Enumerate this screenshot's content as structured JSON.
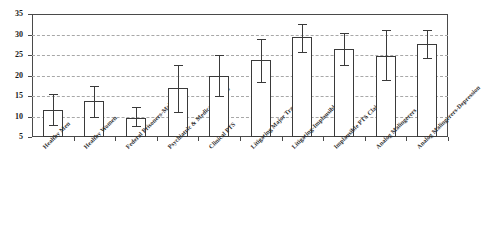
{
  "chart_data": {
    "type": "bar",
    "title": "",
    "xlabel": "",
    "ylabel": "",
    "ylim": [
      5,
      35
    ],
    "yticks": [
      5,
      10,
      15,
      20,
      25,
      30,
      35
    ],
    "grid": true,
    "legend": "none",
    "errorbars": true,
    "categories": [
      "Healthy Men",
      "Healthy Women",
      "Federal Prisoners-Male",
      "Psychiatric & Medical Patients",
      "Clinical PTS",
      "Litigating Major Trauma",
      "Litigating-Implausible PTS",
      "Implausible PTS Claims",
      "Analog Malingerers",
      "Analog Malingerers-Depression"
    ],
    "values": [
      11.5,
      13.8,
      9.7,
      17.0,
      20.0,
      23.8,
      29.5,
      26.5,
      24.7,
      27.8
    ],
    "err_low": [
      8.0,
      10.0,
      7.6,
      11.2,
      15.0,
      18.5,
      25.8,
      22.6,
      19.0,
      24.2
    ],
    "err_high": [
      15.5,
      17.5,
      12.4,
      22.5,
      25.0,
      28.8,
      32.6,
      30.3,
      31.0,
      31.2
    ],
    "bar_fill": "#ffffff",
    "bar_stroke": "#3a3a3a",
    "grid_color": "#a8a8a8",
    "axis_color": "#4a4a4a",
    "text_color": "#1a1a1a"
  }
}
